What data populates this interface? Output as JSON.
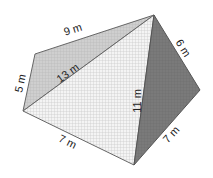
{
  "figure": {
    "type": "triangular pyramid / solid with labeled edges",
    "vertices": {
      "left": [
        23,
        111
      ],
      "upper_left": [
        35,
        54
      ],
      "top": [
        154,
        15
      ],
      "right": [
        200,
        90
      ],
      "bottom": [
        134,
        165
      ]
    },
    "faces": [
      {
        "name": "back-left-face",
        "fill": "#c9c9c9"
      },
      {
        "name": "front-face",
        "fill": "#f2f2f2"
      },
      {
        "name": "right-face",
        "fill": "#7a7a7a"
      }
    ],
    "edge_labels": {
      "top_edge": "9 m",
      "left_short_edge": "5 m",
      "diagonal_edge": "13 m",
      "right_top_edge": "6 m",
      "vertical_edge": "11 m",
      "bottom_left_edge": "7 m",
      "bottom_right_edge": "7 m"
    }
  }
}
